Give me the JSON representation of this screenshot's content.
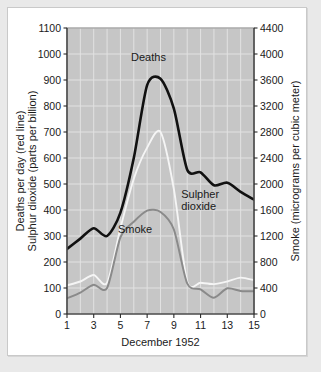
{
  "chart_data": {
    "type": "line",
    "title": "",
    "xlabel": "December 1952",
    "ylabel": "Deaths per day (red line)\nSulphur dioxide (parts per billion)",
    "ylabel_line1": "Deaths per day (red line)",
    "ylabel_line2": "Sulphur dioxide (parts per billion)",
    "y2label": "Smoke (micrograms per cubic meter)",
    "grid": true,
    "legend_position": "inline-annotations",
    "x": [
      1,
      2,
      3,
      4,
      5,
      6,
      7,
      8,
      9,
      10,
      11,
      12,
      13,
      14,
      15
    ],
    "xtick_labels": [
      "1",
      "3",
      "5",
      "7",
      "9",
      "11",
      "13",
      "15"
    ],
    "xtick_values": [
      1,
      3,
      5,
      7,
      9,
      11,
      13,
      15
    ],
    "xlim": [
      1,
      15
    ],
    "ylim": [
      0,
      1100
    ],
    "ytick_labels": [
      "0",
      "100",
      "200",
      "300",
      "400",
      "500",
      "600",
      "700",
      "800",
      "900",
      "1000",
      "1100"
    ],
    "ytick_values": [
      0,
      100,
      200,
      300,
      400,
      500,
      600,
      700,
      800,
      900,
      1000,
      1100
    ],
    "y2lim": [
      0,
      4400
    ],
    "y2tick_labels": [
      "0",
      "400",
      "800",
      "1200",
      "1600",
      "2000",
      "2400",
      "2800",
      "3200",
      "3600",
      "4000",
      "4400"
    ],
    "y2tick_values": [
      0,
      400,
      800,
      1200,
      1600,
      2000,
      2400,
      2800,
      3200,
      3600,
      4000,
      4400
    ],
    "series": [
      {
        "name": "Deaths",
        "annotation": "Deaths",
        "axis": "left",
        "unit": "deaths per day",
        "color": "#111111",
        "values": [
          250,
          290,
          330,
          300,
          390,
          600,
          880,
          905,
          790,
          555,
          545,
          495,
          505,
          470,
          440
        ]
      },
      {
        "name": "Sulpher dioxide",
        "annotation_line1": "Sulpher",
        "annotation_line2": "dioxide",
        "axis": "left",
        "unit": "parts per billion",
        "color": "#f5f5f5",
        "values": [
          110,
          125,
          150,
          120,
          330,
          520,
          640,
          700,
          480,
          125,
          120,
          115,
          125,
          140,
          130
        ]
      },
      {
        "name": "Smoke",
        "annotation": "Smoke",
        "axis": "right",
        "unit": "micrograms per cubic meter",
        "color": "#8a8a8a",
        "values": [
          240,
          330,
          450,
          400,
          1180,
          1420,
          1590,
          1570,
          1300,
          470,
          380,
          250,
          395,
          355,
          350
        ]
      }
    ]
  },
  "annotations": {
    "deaths": "Deaths",
    "sulpher_dioxide_line1": "Sulpher",
    "sulpher_dioxide_line2": "dioxide",
    "smoke": "Smoke"
  },
  "axes": {
    "x_title": "December 1952",
    "y_left_title_line1": "Deaths per day (red line)",
    "y_left_title_line2": "Sulphur dioxide (parts per billion)",
    "y_right_title": "Smoke (micrograms per cubic meter)"
  },
  "colors": {
    "plot_background": "#c6c6c6",
    "gridline": "#e2e2e2",
    "deaths_line": "#111111",
    "sulphur_dioxide_line": "#f5f5f5",
    "smoke_line": "#8a8a8a",
    "card_background": "#ffffff",
    "page_background": "#e9e9e9"
  }
}
